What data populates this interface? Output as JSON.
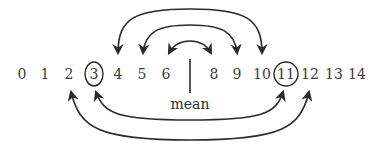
{
  "diagram": {
    "numbers": [
      {
        "label": "0",
        "x": 22
      },
      {
        "label": "1",
        "x": 45
      },
      {
        "label": "2",
        "x": 69
      },
      {
        "label": "3",
        "x": 94,
        "circled": true
      },
      {
        "label": "4",
        "x": 118
      },
      {
        "label": "5",
        "x": 142
      },
      {
        "label": "6",
        "x": 166
      },
      {
        "label": "8",
        "x": 214
      },
      {
        "label": "9",
        "x": 237
      },
      {
        "label": "10",
        "x": 262
      },
      {
        "label": "11",
        "x": 286,
        "circled": true
      },
      {
        "label": "12",
        "x": 310
      },
      {
        "label": "13",
        "x": 334
      },
      {
        "label": "14",
        "x": 357
      }
    ],
    "mean_label": "mean",
    "mean_position_x": 190,
    "top_pairs": [
      {
        "from": "4",
        "to": "10"
      },
      {
        "from": "5",
        "to": "9"
      },
      {
        "from": "6",
        "to": "8"
      }
    ],
    "bottom_pairs": [
      {
        "from": "3",
        "to": "11"
      },
      {
        "from": "2",
        "to": "12"
      }
    ],
    "colors": {
      "ink": "#2b2b2b",
      "background": "#ffffff"
    }
  }
}
